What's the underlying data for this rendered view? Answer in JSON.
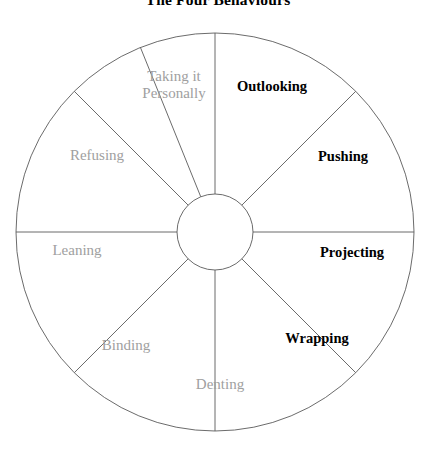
{
  "figure": {
    "title": "The Four Behaviours",
    "title_color": "#000000",
    "background": "#ffffff"
  },
  "wheel": {
    "center_x": 215,
    "center_y": 232,
    "outer_radius": 199,
    "hub_radius": 38,
    "stroke_color": "#5a5a5a",
    "stroke_width": 0.9,
    "segment_count": 8,
    "bold_text_color": "#000000",
    "muted_text_color": "#a0a0a0",
    "segments": [
      {
        "id": "outlooking",
        "label": "Outlooking",
        "style": "bold",
        "start_angle": 90,
        "end_angle": 45,
        "label_x": 272,
        "label_y": 86
      },
      {
        "id": "pushing",
        "label": "Pushing",
        "style": "bold",
        "start_angle": 45,
        "end_angle": 0,
        "label_x": 343,
        "label_y": 156
      },
      {
        "id": "projecting",
        "label": "Projecting",
        "style": "bold",
        "start_angle": 0,
        "end_angle": -45,
        "label_x": 352,
        "label_y": 252
      },
      {
        "id": "wrapping",
        "label": "Wrapping",
        "style": "bold",
        "start_angle": -45,
        "end_angle": -90,
        "label_x": 317,
        "label_y": 338
      },
      {
        "id": "denting",
        "label": "Denting",
        "style": "muted",
        "start_angle": -90,
        "end_angle": -135,
        "label_x": 220,
        "label_y": 384
      },
      {
        "id": "binding",
        "label": "Binding",
        "style": "muted",
        "start_angle": -135,
        "end_angle": 180,
        "label_x": 126,
        "label_y": 345
      },
      {
        "id": "leaning",
        "label": "Leaning",
        "style": "muted",
        "start_angle": 180,
        "end_angle": 135,
        "label_x": 77,
        "label_y": 250
      },
      {
        "id": "refusing",
        "label": "Refusing",
        "style": "muted",
        "start_angle": 135,
        "end_angle": 112,
        "label_x": 97,
        "label_y": 155
      },
      {
        "id": "taking-it-personally",
        "label": "Taking it\nPersonally",
        "label_line1": "Taking it",
        "label_line2": "Personally",
        "style": "muted",
        "start_angle": 112,
        "end_angle": 90,
        "label_x": 174,
        "label_y": 85
      }
    ]
  }
}
